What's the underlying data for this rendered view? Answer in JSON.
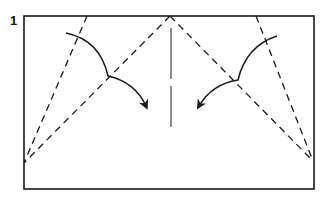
{
  "diagram": {
    "step_number": "1",
    "colors": {
      "line": "#1a1a1a",
      "background": "#ffffff"
    },
    "paper": {
      "x": 24,
      "y": 16,
      "width": 290,
      "height": 173
    },
    "valley_folds": [
      {
        "name": "left-outer",
        "x1": 87,
        "y1": 16,
        "x2": 24,
        "y2": 163
      },
      {
        "name": "left-inner",
        "x1": 170,
        "y1": 16,
        "x2": 24,
        "y2": 163
      },
      {
        "name": "right-inner",
        "x1": 170,
        "y1": 16,
        "x2": 313,
        "y2": 161
      },
      {
        "name": "right-outer",
        "x1": 256,
        "y1": 16,
        "x2": 313,
        "y2": 161
      }
    ],
    "center_crease": {
      "x": 171,
      "y1": 28,
      "y2": 127
    },
    "arrows": [
      {
        "name": "left-fold-arrow",
        "direction": "toward-center"
      },
      {
        "name": "right-fold-arrow",
        "direction": "toward-center"
      }
    ]
  }
}
